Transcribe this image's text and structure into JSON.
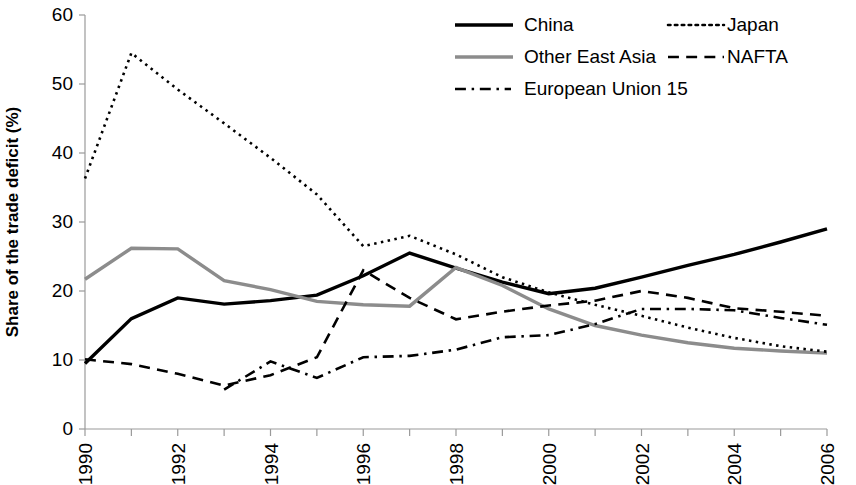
{
  "chart_data": {
    "type": "line",
    "title": "",
    "xlabel": "",
    "ylabel": "Share of the trade deficit (%)",
    "xlim": [
      1990,
      2006
    ],
    "ylim": [
      0,
      60
    ],
    "yticks": [
      0,
      10,
      20,
      30,
      40,
      50,
      60
    ],
    "xticks": [
      1990,
      1991,
      1992,
      1993,
      1994,
      1995,
      1996,
      1997,
      1998,
      1999,
      2000,
      2001,
      2002,
      2003,
      2004,
      2005,
      2006
    ],
    "xtick_labels": [
      "1990",
      "",
      "1992",
      "",
      "1994",
      "",
      "1996",
      "",
      "1998",
      "",
      "2000",
      "",
      "2002",
      "",
      "2004",
      "",
      "2006"
    ],
    "grid": false,
    "legend_position": "top-right",
    "x": [
      1990,
      1991,
      1992,
      1993,
      1994,
      1995,
      1996,
      1997,
      1998,
      1999,
      2000,
      2001,
      2002,
      2003,
      2004,
      2005,
      2006
    ],
    "series": [
      {
        "name": "China",
        "color": "#000000",
        "style": "solid",
        "width": 3.4,
        "values": [
          9.5,
          16.0,
          19.0,
          18.1,
          18.6,
          19.4,
          22.2,
          25.5,
          23.3,
          21.3,
          19.6,
          20.4,
          22.0,
          23.7,
          25.3,
          27.1,
          29.0
        ]
      },
      {
        "name": "Other East Asia",
        "color": "#8c8c8c",
        "style": "solid",
        "width": 3.4,
        "values": [
          21.7,
          26.2,
          26.1,
          21.5,
          20.2,
          18.5,
          18.0,
          17.8,
          23.4,
          20.8,
          17.4,
          15.0,
          13.6,
          12.5,
          11.7,
          11.3,
          11.0
        ]
      },
      {
        "name": "Japan",
        "color": "#000000",
        "style": "dotted",
        "width": 2.6,
        "values": [
          36.3,
          54.5,
          49.2,
          44.3,
          39.3,
          34.0,
          26.5,
          28.0,
          25.3,
          22.0,
          19.8,
          18.0,
          16.4,
          14.7,
          13.2,
          12.0,
          11.2
        ]
      },
      {
        "name": "NAFTA",
        "color": "#000000",
        "style": "dashed",
        "width": 2.6,
        "values": [
          10.1,
          9.4,
          8.0,
          6.3,
          7.8,
          10.4,
          23.0,
          19.0,
          15.9,
          17.0,
          17.9,
          18.6,
          20.0,
          19.0,
          17.5,
          17.0,
          16.4
        ]
      },
      {
        "name": "European Union 15",
        "color": "#000000",
        "style": "dashdot",
        "width": 2.6,
        "values": [
          null,
          null,
          null,
          5.7,
          9.8,
          7.4,
          10.4,
          10.6,
          11.5,
          13.3,
          13.6,
          15.2,
          17.4,
          17.4,
          17.2,
          16.1,
          15.1
        ]
      }
    ]
  },
  "legend": {
    "entries": [
      {
        "label": "China",
        "key": "china"
      },
      {
        "label": "Japan",
        "key": "japan"
      },
      {
        "label": "Other East Asia",
        "key": "other-east-asia"
      },
      {
        "label": "NAFTA",
        "key": "nafta"
      },
      {
        "label": "European Union 15",
        "key": "european-union-15"
      }
    ]
  },
  "axes": {
    "y_title": "Share of the trade deficit (%)"
  },
  "colors": {
    "china": "#000000",
    "other_east_asia": "#8c8c8c",
    "japan": "#000000",
    "nafta": "#000000",
    "eu15": "#000000",
    "axis": "#9a9a9a",
    "background": "#ffffff"
  }
}
